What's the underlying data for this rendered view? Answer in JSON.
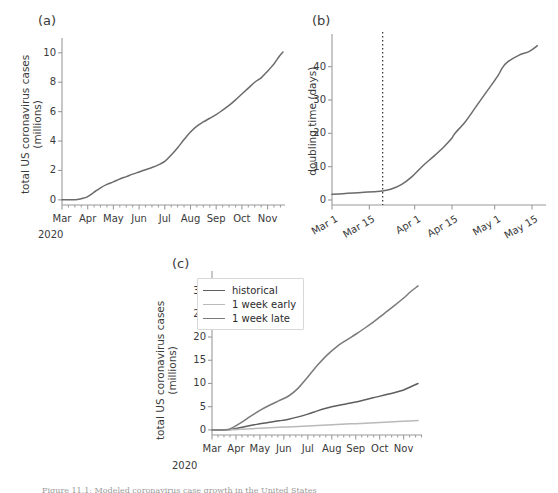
{
  "figure": {
    "caption_partial": "Figure 11.1: Modeled coronavirus case growth in the United States",
    "panel_labels": {
      "a": "(a)",
      "b": "(b)",
      "c": "(c)"
    }
  },
  "colors": {
    "axis": "#9a9a9a",
    "text": "#3a3a3a",
    "line_dark": "#5e5e5e",
    "line_mid": "#7a7a7a",
    "line_light": "#b9b9b9",
    "legend_border": "#d8d8d8",
    "marker_line": "#303030"
  },
  "chart_data": [
    {
      "id": "panel-a",
      "type": "line",
      "title": "(a)",
      "xlabel": "",
      "ylabel": "total US coronavirus cases\n(millions)",
      "ylabel_line1": "total US coronavirus cases",
      "ylabel_line2": "(millions)",
      "xticks": [
        "Mar",
        "Apr",
        "May",
        "Jun",
        "Jul",
        "Aug",
        "Sep",
        "Oct",
        "Nov"
      ],
      "xtick_sublabel": "2020",
      "yticks": [
        0,
        2,
        4,
        6,
        8,
        10
      ],
      "ylim": [
        -0.35,
        10.6
      ],
      "xlim_months": [
        0,
        8.6
      ],
      "grid": false,
      "legend": false,
      "series": [
        {
          "name": "historical",
          "color": "#6b6b6b",
          "x_months": [
            0,
            0.35,
            0.6,
            0.85,
            1.0,
            1.25,
            1.5,
            1.75,
            2.0,
            2.25,
            2.5,
            2.75,
            3.0,
            3.25,
            3.5,
            3.75,
            4.0,
            4.25,
            4.5,
            4.75,
            5.0,
            5.25,
            5.5,
            5.75,
            6.0,
            6.25,
            6.5,
            6.75,
            7.0,
            7.25,
            7.5,
            7.75,
            8.0,
            8.25,
            8.45,
            8.6
          ],
          "values": [
            0.0,
            0.0,
            0.02,
            0.12,
            0.22,
            0.52,
            0.82,
            1.05,
            1.22,
            1.42,
            1.58,
            1.75,
            1.9,
            2.05,
            2.2,
            2.38,
            2.62,
            3.05,
            3.55,
            4.1,
            4.62,
            5.02,
            5.3,
            5.55,
            5.8,
            6.1,
            6.42,
            6.8,
            7.2,
            7.6,
            8.0,
            8.3,
            8.75,
            9.25,
            9.75,
            10.05
          ]
        }
      ]
    },
    {
      "id": "panel-b",
      "type": "line",
      "title": "(b)",
      "xlabel": "",
      "ylabel": "doubling time (days)",
      "xticks": [
        "Mar 1",
        "Mar 15",
        "Apr 1",
        "Apr 15",
        "May 1",
        "May 15"
      ],
      "xtick_rotation_deg": -30,
      "yticks": [
        0,
        10,
        20,
        30,
        40
      ],
      "ylim": [
        -1.5,
        48
      ],
      "xlim_days": [
        0,
        78
      ],
      "grid": false,
      "legend": false,
      "annotations": [
        {
          "type": "vline",
          "label": "intervention-marker",
          "x_days": 19,
          "style": "dotted",
          "color": "#303030"
        }
      ],
      "series": [
        {
          "name": "doubling time",
          "color": "#6b6b6b",
          "x_days": [
            0,
            4,
            8,
            12,
            16,
            19,
            22,
            26,
            30,
            34,
            38,
            42,
            45,
            46,
            50,
            54,
            58,
            62,
            64,
            66,
            70,
            74,
            77
          ],
          "values": [
            1.7,
            1.9,
            2.1,
            2.3,
            2.5,
            2.7,
            3.2,
            4.6,
            7.0,
            10.2,
            13.0,
            16.0,
            18.6,
            19.9,
            23.5,
            28.0,
            32.5,
            37.0,
            39.8,
            41.5,
            43.4,
            44.6,
            46.3
          ]
        }
      ]
    },
    {
      "id": "panel-c",
      "type": "line",
      "title": "(c)",
      "xlabel": "",
      "ylabel_line1": "total US coronavirus cases",
      "ylabel_line2": "(millions)",
      "xticks": [
        "Mar",
        "Apr",
        "May",
        "Jun",
        "Jul",
        "Aug",
        "Sep",
        "Oct",
        "Nov"
      ],
      "xtick_sublabel": "2020",
      "yticks": [
        0,
        5,
        10,
        15,
        20,
        25,
        30
      ],
      "ylim": [
        -1.1,
        32.5
      ],
      "xlim_months": [
        0,
        8.6
      ],
      "grid": false,
      "legend": true,
      "legend_position": "upper left",
      "legend_entries": [
        "historical",
        "1 week early",
        "1 week late"
      ],
      "series": [
        {
          "name": "historical",
          "color": "#5e5e5e",
          "x_months": [
            0,
            0.6,
            0.9,
            1.2,
            1.6,
            2.0,
            2.4,
            2.8,
            3.2,
            3.6,
            4.0,
            4.4,
            4.8,
            5.2,
            5.6,
            6.0,
            6.4,
            6.8,
            7.2,
            7.6,
            8.0,
            8.3,
            8.6
          ],
          "values": [
            0.0,
            0.02,
            0.2,
            0.5,
            0.95,
            1.3,
            1.65,
            1.95,
            2.3,
            2.8,
            3.4,
            4.1,
            4.7,
            5.2,
            5.6,
            6.0,
            6.5,
            7.0,
            7.5,
            8.0,
            8.6,
            9.3,
            10.0
          ]
        },
        {
          "name": "1 week early",
          "color": "#b9b9b9",
          "x_months": [
            0,
            0.6,
            0.9,
            1.2,
            1.6,
            2.0,
            2.4,
            2.8,
            3.2,
            3.6,
            4.0,
            4.4,
            4.8,
            5.2,
            5.6,
            6.0,
            6.4,
            6.8,
            7.2,
            7.6,
            8.0,
            8.3,
            8.6
          ],
          "values": [
            0.0,
            0.0,
            0.05,
            0.12,
            0.25,
            0.35,
            0.45,
            0.55,
            0.65,
            0.75,
            0.85,
            0.95,
            1.05,
            1.15,
            1.25,
            1.35,
            1.45,
            1.55,
            1.65,
            1.75,
            1.85,
            1.92,
            2.0
          ]
        },
        {
          "name": "1 week late",
          "color": "#7a7a7a",
          "x_months": [
            0,
            0.6,
            0.9,
            1.2,
            1.6,
            2.0,
            2.4,
            2.8,
            3.2,
            3.6,
            4.0,
            4.4,
            4.8,
            5.2,
            5.6,
            6.0,
            6.4,
            6.8,
            7.2,
            7.6,
            8.0,
            8.3,
            8.6
          ],
          "values": [
            0.0,
            0.05,
            0.6,
            1.5,
            2.9,
            4.2,
            5.3,
            6.3,
            7.3,
            9.0,
            11.4,
            13.9,
            16.1,
            17.9,
            19.3,
            20.6,
            22.0,
            23.5,
            25.1,
            26.7,
            28.4,
            29.8,
            31.0
          ]
        }
      ]
    }
  ]
}
